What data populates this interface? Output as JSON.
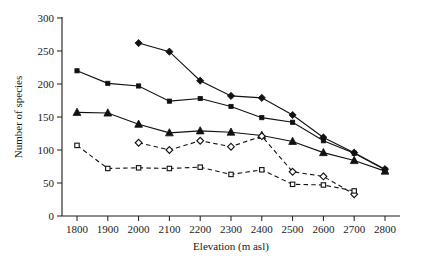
{
  "chart_data": {
    "type": "line",
    "title": "",
    "xlabel": "Elevation (m asl)",
    "ylabel": "Number of species",
    "xlim": [
      1750,
      2850
    ],
    "ylim": [
      0,
      300
    ],
    "xticks": [
      1800,
      1900,
      2000,
      2100,
      2200,
      2300,
      2400,
      2500,
      2600,
      2700,
      2800
    ],
    "yticks": [
      0,
      50,
      100,
      150,
      200,
      250,
      300
    ],
    "grid": false,
    "legend": "none",
    "series": [
      {
        "name": "filled-diamond-series",
        "marker": "filled-diamond",
        "line": "solid",
        "x": [
          2000,
          2100,
          2200,
          2300,
          2400,
          2500,
          2600,
          2700,
          2800
        ],
        "values": [
          262,
          249,
          205,
          182,
          179,
          153,
          119,
          96,
          71
        ]
      },
      {
        "name": "filled-square-series",
        "marker": "filled-square",
        "line": "solid",
        "x": [
          1800,
          1900,
          2000,
          2100,
          2200,
          2300,
          2400,
          2500,
          2600,
          2700,
          2800
        ],
        "values": [
          220,
          201,
          197,
          174,
          178,
          166,
          149,
          142,
          114,
          95,
          70
        ]
      },
      {
        "name": "filled-triangle-series",
        "marker": "filled-triangle",
        "line": "solid",
        "x": [
          1800,
          1900,
          2000,
          2100,
          2200,
          2300,
          2400,
          2500,
          2600,
          2700,
          2800
        ],
        "values": [
          157,
          156,
          139,
          126,
          129,
          127,
          122,
          113,
          96,
          84,
          68
        ]
      },
      {
        "name": "open-diamond-series",
        "marker": "open-diamond",
        "line": "dashed",
        "x": [
          2000,
          2100,
          2200,
          2300,
          2400,
          2500,
          2600,
          2700
        ],
        "values": [
          111,
          100,
          114,
          105,
          121,
          67,
          60,
          33
        ]
      },
      {
        "name": "open-square-series",
        "marker": "open-square",
        "line": "dashed",
        "x": [
          1800,
          1900,
          2000,
          2100,
          2200,
          2300,
          2400,
          2500,
          2600,
          2700
        ],
        "values": [
          107,
          72,
          73,
          72,
          74,
          63,
          70,
          48,
          47,
          38
        ]
      }
    ]
  },
  "axes": {
    "y_title": "Number of species",
    "x_title": "Elevation (m asl)",
    "y_tick_labels": [
      "300",
      "250",
      "200",
      "150",
      "100",
      "50",
      "0"
    ],
    "x_tick_labels": [
      "1800",
      "1900",
      "2000",
      "2100",
      "2200",
      "2300",
      "2400",
      "2500",
      "2600",
      "2700",
      "2800"
    ]
  }
}
